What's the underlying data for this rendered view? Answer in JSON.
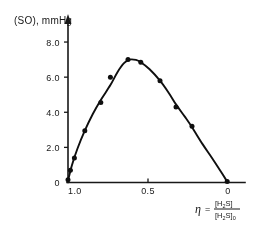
{
  "chart_data": {
    "type": "line",
    "title": "",
    "ylabel": "(SO), mmHg",
    "xlabel": "η = [H₂S] / [H₂S]₀",
    "xlabel_parts": {
      "symbol": "η",
      "equals": "=",
      "numerator": "[H",
      "numerator_sub": "2",
      "numerator_tail": "S]",
      "denominator": "[H",
      "denominator_sub": "2",
      "denominator_tail": "S]",
      "denominator_zero": "0"
    },
    "x_ticks": [
      "1.0",
      "0.5",
      "0"
    ],
    "x_tick_values": [
      1.0,
      0.5,
      0.0
    ],
    "y_ticks": [
      "0",
      "2.0",
      "4.0",
      "6.0",
      "8.0"
    ],
    "y_tick_values": [
      0,
      2.0,
      4.0,
      6.0,
      8.0
    ],
    "xlim": [
      1.0,
      0.0
    ],
    "ylim": [
      0,
      8.8
    ],
    "x_axis_reversed": true,
    "grid": false,
    "legend": false,
    "marker": "filled-circle",
    "points": [
      {
        "x": 1.0,
        "y": 0.15
      },
      {
        "x": 0.985,
        "y": 0.7
      },
      {
        "x": 0.96,
        "y": 1.4
      },
      {
        "x": 0.895,
        "y": 2.95
      },
      {
        "x": 0.795,
        "y": 4.55
      },
      {
        "x": 0.735,
        "y": 6.0
      },
      {
        "x": 0.625,
        "y": 7.0
      },
      {
        "x": 0.545,
        "y": 6.85
      },
      {
        "x": 0.425,
        "y": 5.8
      },
      {
        "x": 0.325,
        "y": 4.3
      },
      {
        "x": 0.225,
        "y": 3.2
      },
      {
        "x": 0.005,
        "y": 0.05
      }
    ],
    "curve": [
      {
        "x": 1.0,
        "y": 0.1
      },
      {
        "x": 0.975,
        "y": 1.0
      },
      {
        "x": 0.94,
        "y": 1.95
      },
      {
        "x": 0.895,
        "y": 2.95
      },
      {
        "x": 0.845,
        "y": 3.9
      },
      {
        "x": 0.795,
        "y": 4.7
      },
      {
        "x": 0.735,
        "y": 5.55
      },
      {
        "x": 0.69,
        "y": 6.3
      },
      {
        "x": 0.65,
        "y": 6.8
      },
      {
        "x": 0.615,
        "y": 7.0
      },
      {
        "x": 0.575,
        "y": 6.98
      },
      {
        "x": 0.545,
        "y": 6.85
      },
      {
        "x": 0.49,
        "y": 6.45
      },
      {
        "x": 0.425,
        "y": 5.8
      },
      {
        "x": 0.37,
        "y": 5.1
      },
      {
        "x": 0.325,
        "y": 4.45
      },
      {
        "x": 0.27,
        "y": 3.75
      },
      {
        "x": 0.225,
        "y": 3.15
      },
      {
        "x": 0.16,
        "y": 2.2
      },
      {
        "x": 0.1,
        "y": 1.4
      },
      {
        "x": 0.05,
        "y": 0.7
      },
      {
        "x": 0.005,
        "y": 0.05
      }
    ],
    "colors": {
      "ink": "#111111",
      "axis": "#1a1a1a",
      "background": "#ffffff"
    }
  }
}
